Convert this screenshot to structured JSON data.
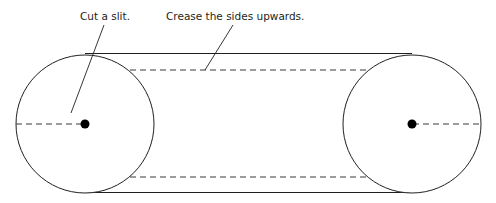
{
  "figure": {
    "background_color": "#ffffff",
    "line_color": "#231f20",
    "dash_color": "#3b3b3b",
    "dot_color": "#000000"
  },
  "annotations": [
    {
      "id": "cut-a-slit",
      "text": "Cut a slit.",
      "text_x": 80,
      "text_y": 20,
      "leader": {
        "x1": 104,
        "y1": 25,
        "x2": 71,
        "y2": 113
      }
    },
    {
      "id": "crease-the-sides-upwards",
      "text": "Crease the sides upwards.",
      "text_x": 166,
      "text_y": 20,
      "leader": {
        "x1": 233,
        "y1": 25,
        "x2": 205,
        "y2": 70
      }
    }
  ],
  "shapes": {
    "left_circle": {
      "cx": 85,
      "cy": 124,
      "r": 69
    },
    "right_circle": {
      "cx": 412,
      "cy": 124,
      "r": 69
    },
    "left_center_dot": {
      "cx": 85,
      "cy": 124,
      "r": 4.5
    },
    "right_center_dot": {
      "cx": 412,
      "cy": 124,
      "r": 4.5
    },
    "top_solid_line": {
      "x1": 85,
      "y1": 53.5,
      "x2": 412,
      "y2": 53.5
    },
    "bottom_solid_line": {
      "x1": 85,
      "y1": 192.5,
      "x2": 412,
      "y2": 192.5
    },
    "top_dashed_line": {
      "x1": 130,
      "y1": 70,
      "x2": 366,
      "y2": 70
    },
    "bottom_dashed_line": {
      "x1": 130,
      "y1": 177,
      "x2": 366,
      "y2": 177
    },
    "left_slit_dashed_line": {
      "x1": 16,
      "y1": 124,
      "x2": 84,
      "y2": 124
    },
    "right_axis_dashed_line": {
      "x1": 413,
      "y1": 124,
      "x2": 481,
      "y2": 124
    }
  }
}
